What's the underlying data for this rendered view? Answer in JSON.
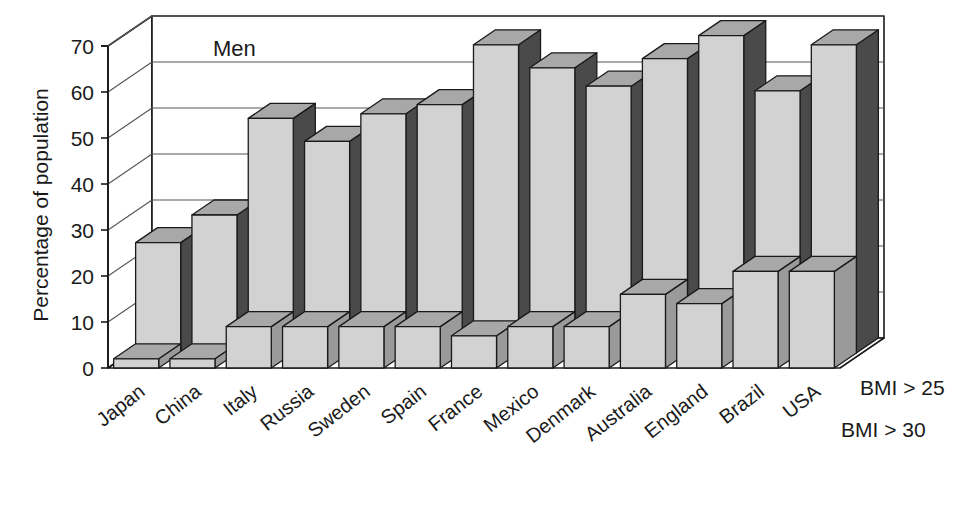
{
  "chart_data": {
    "type": "bar",
    "title": "Men",
    "xlabel": "",
    "ylabel": "Percentage of population",
    "ylim": [
      0,
      70
    ],
    "yticks": [
      0,
      10,
      20,
      30,
      40,
      50,
      60,
      70
    ],
    "ytick_labels": [
      "0",
      "10",
      "20",
      "30",
      "40",
      "50",
      "60",
      "70"
    ],
    "grid": true,
    "legend_position": "right",
    "projection": "3d-two-row",
    "categories": [
      "Japan",
      "China",
      "Italy",
      "Russia",
      "Sweden",
      "Spain",
      "France",
      "Mexico",
      "Denmark",
      "Australia",
      "England",
      "Brazil",
      "USA"
    ],
    "series": [
      {
        "name": "BMI > 25",
        "row": "back",
        "values": [
          24,
          30,
          51,
          46,
          52,
          54,
          67,
          62,
          58,
          64,
          69,
          57,
          67
        ]
      },
      {
        "name": "BMI > 30",
        "row": "front",
        "values": [
          2,
          2,
          9,
          9,
          9,
          9,
          7,
          9,
          9,
          16,
          14,
          21,
          21
        ]
      }
    ],
    "annotations": []
  },
  "legend": {
    "items": [
      {
        "label": "BMI > 25"
      },
      {
        "label": "BMI > 30"
      }
    ]
  },
  "axis": {
    "y_title": "Percentage of population",
    "y_tick_labels": [
      "70",
      "60",
      "50",
      "40",
      "30",
      "20",
      "10",
      "0"
    ]
  },
  "panel": {
    "series_title": "Men"
  },
  "colors": {
    "bar_front": "#d2d2d2",
    "bar_top": "#a8a8a8",
    "bar_side_back": "#4a4a4a",
    "bar_side_front": "#9a9a9a",
    "floor": "#ffffff",
    "outline": "#1a1a1a",
    "text": "#1a1a1a",
    "grid": "#555555"
  }
}
